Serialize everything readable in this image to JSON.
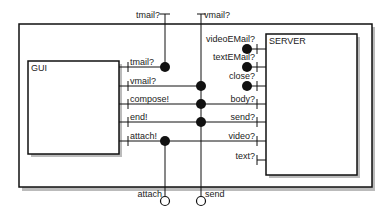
{
  "diagram": {
    "components": {
      "gui": {
        "label": "GUI"
      },
      "server": {
        "label": "SERVER"
      }
    },
    "external_ports_top": [
      {
        "label": "tmail?"
      },
      {
        "label": "vmail?"
      }
    ],
    "external_ports_bottom": [
      {
        "label": "attach"
      },
      {
        "label": "send"
      }
    ],
    "gui_ports": [
      {
        "label": "tmail?"
      },
      {
        "label": "vmail?"
      },
      {
        "label": "compose!"
      },
      {
        "label": "end!"
      },
      {
        "label": "attach!"
      }
    ],
    "server_ports": [
      {
        "label": "videoEMail?"
      },
      {
        "label": "textEMail?"
      },
      {
        "label": "close?"
      },
      {
        "label": "body?"
      },
      {
        "label": "send?"
      },
      {
        "label": "video?"
      },
      {
        "label": "text?"
      }
    ]
  }
}
